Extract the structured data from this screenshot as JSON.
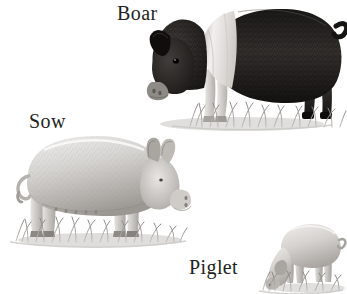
{
  "plate": {
    "title": "Pigs",
    "medium": "grayscale pencil illustration",
    "background_color": "#ffffff",
    "width": 347,
    "height": 294
  },
  "labels": [
    {
      "id": "boar",
      "text": "Boar",
      "color": "#231f1d",
      "font_style": "serif"
    },
    {
      "id": "sow",
      "text": "Sow",
      "color": "#231f1d",
      "font_style": "serif"
    },
    {
      "id": "piglet",
      "text": "Piglet",
      "color": "#231f1d",
      "font_style": "serif"
    }
  ],
  "figures": [
    {
      "id": "boar",
      "label": "Boar",
      "position": "top-right",
      "facing": "left",
      "pose": "standing, head lowered",
      "coat": "black with white shoulder belt",
      "body_color": "#2a2725",
      "belt_color": "#e9e7e4",
      "snout_color": "#8e8a86",
      "features": [
        "curly tail",
        "forward pointed ear",
        "visible eye",
        "white front legs",
        "dark hind legs",
        "grass tuft at feet"
      ]
    },
    {
      "id": "sow",
      "label": "Sow",
      "position": "middle-left",
      "facing": "right",
      "pose": "standing",
      "coat": "light gray-white",
      "body_color": "#d9d7d4",
      "shade_color": "#a9a6a2",
      "features": [
        "two upright ears",
        "snout",
        "row of teats along belly",
        "curly tail",
        "grass tuft at feet"
      ]
    },
    {
      "id": "piglet",
      "label": "Piglet",
      "position": "bottom-right",
      "facing": "left",
      "pose": "head down grazing",
      "coat": "light gray",
      "body_color": "#ddd9d5",
      "shade_color": "#aaa6a2",
      "features": [
        "head lowered into grass",
        "thin tail",
        "grass tuft at feet"
      ]
    }
  ],
  "ground": {
    "type": "grass tufts",
    "color": "#9d9a96",
    "shadow_color": "#c9c7c4"
  }
}
